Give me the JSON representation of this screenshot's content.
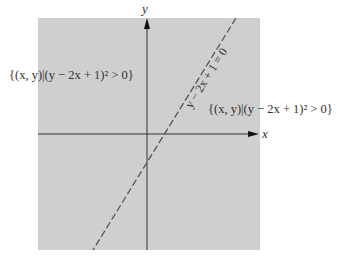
{
  "diagram": {
    "region_color": "#cfcfcf",
    "axis_color": "#333333",
    "line_color": "#555555",
    "x_axis_label": "x",
    "y_axis_label": "y",
    "line_equation": "y − 2x + 1 = 0",
    "region_left_label": "{(x, y)|(y − 2x + 1)² > 0}",
    "region_right_label": "{(x, y)|(y − 2x + 1)² > 0}",
    "line_style": "dashed"
  }
}
